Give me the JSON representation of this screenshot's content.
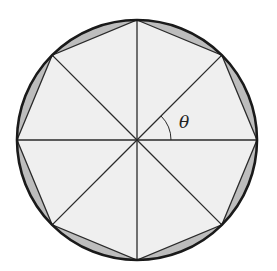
{
  "diagram": {
    "type": "regular octagon inscribed in circle",
    "center": [
      137,
      140
    ],
    "radius": 120,
    "sides": 8,
    "angle_label": "θ",
    "colors": {
      "circle_stroke": "#1a1a1a",
      "polygon_fill": "#efefef",
      "segment_fill": "#bdbdbd",
      "line": "#2a2a2a"
    }
  }
}
